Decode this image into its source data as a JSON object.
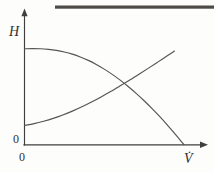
{
  "figure": {
    "background_color": "#fdfdfb",
    "line_color": "#545452",
    "axis_color": "#3f3f3f",
    "scan_rule_color": "#4c4a47"
  },
  "labels": {
    "y_axis": "H",
    "x_axis": "V̇",
    "origin_y": "0",
    "origin_x": "0"
  },
  "chart_data": {
    "type": "line",
    "title": "",
    "subtitle": "",
    "xlabel": "V̇",
    "ylabel": "H",
    "xlim": [
      0,
      1
    ],
    "ylim": [
      0,
      1
    ],
    "grid": false,
    "legend": "none",
    "tick_labels": {
      "x": [
        "0"
      ],
      "y": [
        "0",
        "H"
      ]
    },
    "annotations": [
      {
        "name": "operating-point",
        "x": 0.737,
        "y": 0.544,
        "label": ""
      }
    ],
    "series": [
      {
        "name": "pump-characteristic-curve",
        "description": "Pump head curve: flat at H near shutoff, falling steeply toward maximum flow",
        "color": "#545452",
        "points": [
          [
            0.0,
            0.844
          ],
          [
            0.05,
            0.845
          ],
          [
            0.1,
            0.844
          ],
          [
            0.15,
            0.839
          ],
          [
            0.2,
            0.83
          ],
          [
            0.25,
            0.816
          ],
          [
            0.3,
            0.797
          ],
          [
            0.35,
            0.772
          ],
          [
            0.4,
            0.742
          ],
          [
            0.45,
            0.706
          ],
          [
            0.5,
            0.665
          ],
          [
            0.55,
            0.619
          ],
          [
            0.6,
            0.568
          ],
          [
            0.65,
            0.512
          ],
          [
            0.7,
            0.452
          ],
          [
            0.737,
            0.544
          ],
          [
            0.75,
            0.387
          ],
          [
            0.8,
            0.318
          ],
          [
            0.85,
            0.245
          ],
          [
            0.9,
            0.167
          ],
          [
            0.95,
            0.086
          ],
          [
            1.0,
            0.0
          ]
        ]
      },
      {
        "name": "system-resistance-curve",
        "description": "System curve: rises from static head, concave, crossing pump curve at operating point",
        "color": "#545452",
        "points": [
          [
            0.0,
            0.17
          ],
          [
            0.06,
            0.186
          ],
          [
            0.12,
            0.207
          ],
          [
            0.18,
            0.232
          ],
          [
            0.24,
            0.262
          ],
          [
            0.3,
            0.296
          ],
          [
            0.36,
            0.334
          ],
          [
            0.42,
            0.376
          ],
          [
            0.48,
            0.421
          ],
          [
            0.54,
            0.468
          ],
          [
            0.6,
            0.518
          ],
          [
            0.66,
            0.569
          ],
          [
            0.72,
            0.622
          ],
          [
            0.78,
            0.676
          ],
          [
            0.84,
            0.731
          ],
          [
            0.9,
            0.786
          ],
          [
            0.94,
            0.824
          ]
        ]
      }
    ]
  }
}
